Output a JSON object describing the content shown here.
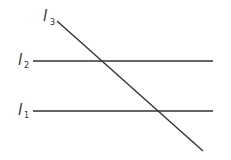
{
  "diagram": {
    "type": "transversal-parallel-lines",
    "line_color": "#333333",
    "lines": [
      {
        "id": "l1",
        "name": "l",
        "subscript": "1",
        "x1": 33,
        "y1": 111,
        "x2": 213,
        "y2": 111
      },
      {
        "id": "l2",
        "name": "l",
        "subscript": "2",
        "x1": 33,
        "y1": 61,
        "x2": 213,
        "y2": 61
      },
      {
        "id": "l3",
        "name": "l",
        "subscript": "3",
        "x1": 57,
        "y1": 21,
        "x2": 203,
        "y2": 151
      }
    ],
    "labels": {
      "l1": {
        "main": "l",
        "sub": "1"
      },
      "l2": {
        "main": "l",
        "sub": "2"
      },
      "l3": {
        "main": "l",
        "sub": "3"
      }
    }
  }
}
